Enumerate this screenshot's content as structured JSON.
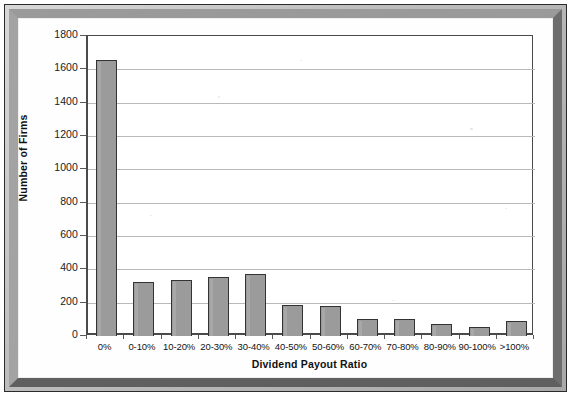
{
  "figure": {
    "kind": "scanned-bar-chart-figure",
    "frame_color": "#8f8f8f",
    "plot_background": "#ffffff"
  },
  "chart_data": {
    "type": "bar",
    "title": "",
    "xlabel": "Dividend Payout Ratio",
    "ylabel": "Number of Firms",
    "categories": [
      "0%",
      "0-10%",
      "10-20%",
      "20-30%",
      "30-40%",
      "40-50%",
      "50-60%",
      "60-70%",
      "70-80%",
      "80-90%",
      "90-100%",
      ">100%"
    ],
    "values": [
      1655,
      325,
      335,
      355,
      370,
      185,
      180,
      100,
      100,
      75,
      55,
      90
    ],
    "ylim": [
      0,
      1800
    ],
    "ytick_step": 200,
    "yticks": [
      0,
      200,
      400,
      600,
      800,
      1000,
      1200,
      1400,
      1600,
      1800
    ],
    "ytick_labels": [
      "0",
      "200",
      "400",
      "600",
      "800",
      "1000",
      "1200",
      "1400",
      "1600",
      "1800"
    ],
    "grid": "horizontal",
    "legend": "none",
    "series": [
      {
        "name": "Number of Firms",
        "bar_fill": "#9b9b9b",
        "bar_border": "#333333",
        "values": [
          1655,
          325,
          335,
          355,
          370,
          185,
          180,
          100,
          100,
          75,
          55,
          90
        ]
      }
    ],
    "annotations": []
  }
}
